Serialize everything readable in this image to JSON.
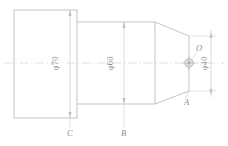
{
  "drawing": {
    "type": "mechanical-part-front-view",
    "line_color": "#b9b9b9",
    "center_line_color": "#c9c9c9",
    "text_color": "#8a8a8a",
    "background": "#ffffff",
    "dimensions": [
      {
        "id": "dia70",
        "label": "φ70",
        "value": 70,
        "symbol": "φ",
        "orientation": "vertical",
        "at_section": "C"
      },
      {
        "id": "dia60",
        "label": "φ60",
        "value": 60,
        "symbol": "φ",
        "orientation": "vertical",
        "at_section": "B"
      },
      {
        "id": "dia40",
        "label": "φ40",
        "value": 40,
        "symbol": "φ",
        "orientation": "vertical",
        "at_section": "A"
      }
    ],
    "markers": [
      {
        "id": "point-A",
        "label": "A",
        "position": "bottom-right"
      },
      {
        "id": "point-B",
        "label": "B",
        "position": "bottom-middle"
      },
      {
        "id": "point-C",
        "label": "C",
        "position": "bottom-left"
      },
      {
        "id": "point-O",
        "label": "O",
        "position": "center-right"
      }
    ]
  }
}
